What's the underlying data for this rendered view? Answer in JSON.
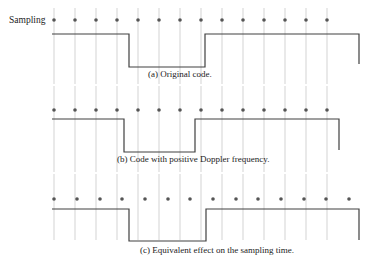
{
  "figure": {
    "sampling_label": "Sampling",
    "panels": [
      {
        "id": "a",
        "caption": "(a) Original code.",
        "sample_x": [
          54,
          75,
          96,
          117,
          138,
          159,
          180,
          201,
          222,
          243,
          264,
          285,
          306,
          327
        ],
        "grid_x": [
          54,
          75,
          96,
          117,
          138,
          159,
          180,
          201,
          222,
          243,
          264,
          285,
          306,
          327
        ],
        "dot_y": 20,
        "grid_top": 8,
        "grid_bottom": 84,
        "high_y": 34,
        "low_y": 67,
        "wave": [
          [
            52,
            34
          ],
          [
            129,
            34
          ],
          [
            129,
            67
          ],
          [
            205,
            67
          ],
          [
            205,
            34
          ],
          [
            359,
            34
          ],
          [
            359,
            64
          ]
        ],
        "caption_x": 148,
        "caption_y": 77
      },
      {
        "id": "b",
        "caption": "(b) Code with positive Doppler frequency.",
        "sample_x": [
          54,
          75,
          96,
          117,
          138,
          159,
          180,
          201,
          222,
          243,
          264,
          285,
          306,
          327
        ],
        "grid_x": [
          54,
          75,
          96,
          117,
          138,
          159,
          180,
          201,
          222,
          243,
          264,
          285,
          306,
          327
        ],
        "dot_y": 110,
        "grid_top": 86,
        "grid_bottom": 172,
        "high_y": 119,
        "low_y": 152,
        "wave": [
          [
            52,
            119
          ],
          [
            124,
            119
          ],
          [
            124,
            152
          ],
          [
            195,
            152
          ],
          [
            195,
            119
          ],
          [
            339,
            119
          ],
          [
            339,
            150
          ]
        ],
        "caption_x": 117,
        "caption_y": 162
      },
      {
        "id": "c",
        "caption": "(c) Equivalent effect on the sampling time.",
        "sample_x": [
          54,
          77,
          100,
          122,
          145,
          168,
          190,
          213,
          236,
          258,
          281,
          304,
          326,
          349
        ],
        "grid_x": [
          54,
          75,
          96,
          117,
          138,
          159,
          180,
          201,
          222,
          243,
          264,
          285,
          306,
          327
        ],
        "dot_y": 199,
        "grid_top": 174,
        "grid_bottom": 240,
        "high_y": 209,
        "low_y": 241,
        "wave": [
          [
            52,
            209
          ],
          [
            129,
            209
          ],
          [
            129,
            241
          ],
          [
            206,
            241
          ],
          [
            206,
            209
          ],
          [
            359,
            209
          ],
          [
            359,
            240
          ]
        ],
        "caption_x": 140,
        "caption_y": 253
      }
    ],
    "colors": {
      "grid": "#c8c8c8",
      "wave": "#404040",
      "dot": "#555555"
    }
  }
}
